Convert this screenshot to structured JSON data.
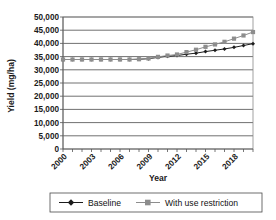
{
  "chart_data": {
    "type": "line",
    "title": "",
    "xlabel": "Year",
    "ylabel": "Yield (mg/ha)",
    "ylim": [
      0,
      50000
    ],
    "xlim": [
      2000,
      2020
    ],
    "grid": true,
    "legend_position": "bottom",
    "ytick_labels": [
      "50,000",
      "45,000",
      "40,000",
      "35,000",
      "30,000",
      "25,000",
      "20,000",
      "15,000",
      "10,000",
      "5,000",
      "0"
    ],
    "ytick_values": [
      50000,
      45000,
      40000,
      35000,
      30000,
      25000,
      20000,
      15000,
      10000,
      5000,
      0
    ],
    "xtick_labels": [
      "2000",
      "2003",
      "2006",
      "2009",
      "2012",
      "2015",
      "2018"
    ],
    "xtick_values": [
      2000,
      2003,
      2006,
      2009,
      2012,
      2015,
      2018
    ],
    "x": [
      2000,
      2001,
      2002,
      2003,
      2004,
      2005,
      2006,
      2007,
      2008,
      2009,
      2010,
      2011,
      2012,
      2013,
      2014,
      2015,
      2016,
      2017,
      2018,
      2019,
      2020
    ],
    "series": [
      {
        "name": "Baseline",
        "marker": "diamond",
        "color": "#1c1c1c",
        "values": [
          33900,
          33900,
          33900,
          33900,
          33900,
          33900,
          33900,
          33900,
          34000,
          34200,
          34700,
          35100,
          35400,
          35900,
          36300,
          36900,
          37400,
          37900,
          38500,
          39200,
          39900
        ]
      },
      {
        "name": "With use restriction",
        "marker": "square",
        "color": "#8d8d8d",
        "values": [
          33900,
          33900,
          33900,
          33900,
          33900,
          33900,
          33900,
          33900,
          34000,
          34300,
          34900,
          35400,
          35800,
          36700,
          37600,
          38700,
          39600,
          40600,
          41800,
          43000,
          44300
        ]
      }
    ]
  },
  "legend": {
    "items": [
      {
        "label": "Baseline",
        "marker": "diamond",
        "color": "#1c1c1c"
      },
      {
        "label": "With use restriction",
        "marker": "square",
        "color": "#8d8d8d"
      }
    ]
  }
}
